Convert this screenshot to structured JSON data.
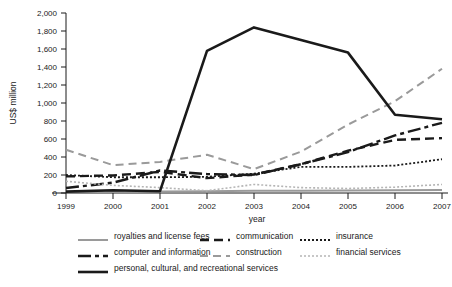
{
  "chart_data": {
    "type": "line",
    "title": "",
    "xlabel": "year",
    "ylabel": "US$ million",
    "x": [
      1999,
      2000,
      2001,
      2002,
      2003,
      2004,
      2005,
      2006,
      2007
    ],
    "xtick_labels": [
      "1999",
      "2000",
      "2001",
      "2002",
      "2003",
      "2004",
      "2005",
      "2006",
      "2007"
    ],
    "ytick_labels": [
      "0",
      "200",
      "400",
      "600",
      "800",
      "1,000",
      "1,200",
      "1,400",
      "1,600",
      "1,800",
      "2,000"
    ],
    "yticks": [
      0,
      200,
      400,
      600,
      800,
      1000,
      1200,
      1400,
      1600,
      1800,
      2000
    ],
    "ylim": [
      0,
      2000
    ],
    "grid": false,
    "legend_position": "below",
    "series": [
      {
        "name": "royalties and license fees",
        "style": "solid",
        "color": "#9a9a9a",
        "width": 2.0,
        "dash": "none",
        "values": [
          10,
          15,
          18,
          20,
          24,
          26,
          28,
          30,
          32
        ]
      },
      {
        "name": "communication",
        "style": "dashed",
        "color": "#1a1a1a",
        "width": 2.4,
        "dash": "9,5",
        "values": [
          185,
          195,
          235,
          165,
          205,
          320,
          470,
          590,
          610
        ]
      },
      {
        "name": "insurance",
        "style": "dotted",
        "color": "#1a1a1a",
        "width": 1.8,
        "dash": "2,2",
        "values": [
          200,
          175,
          175,
          180,
          215,
          290,
          290,
          305,
          375
        ]
      },
      {
        "name": "computer and information",
        "style": "dash-dot",
        "color": "#1a1a1a",
        "width": 2.4,
        "dash": "13,4,4,4",
        "values": [
          55,
          115,
          250,
          210,
          200,
          320,
          455,
          640,
          780
        ]
      },
      {
        "name": "construction",
        "style": "dashed",
        "color": "#9a9a9a",
        "width": 2.0,
        "dash": "8,5",
        "values": [
          480,
          310,
          345,
          425,
          265,
          460,
          760,
          1020,
          1380
        ]
      },
      {
        "name": "financial services",
        "style": "dotted",
        "color": "#b5b5b5",
        "width": 1.6,
        "dash": "2,2",
        "values": [
          130,
          85,
          60,
          25,
          95,
          60,
          50,
          65,
          95
        ]
      },
      {
        "name": "personal, cultural, and recreational services",
        "style": "solid",
        "color": "#1a1a1a",
        "width": 2.6,
        "dash": "none",
        "values": [
          15,
          30,
          20,
          1580,
          1840,
          1700,
          1560,
          870,
          820
        ]
      }
    ]
  },
  "legend": {
    "rows": [
      [
        {
          "key": "royalties-and-license-fees",
          "label": "royalties and license fees"
        },
        {
          "key": "communication",
          "label": "communication"
        },
        {
          "key": "insurance",
          "label": "insurance"
        }
      ],
      [
        {
          "key": "computer-and-information",
          "label": "computer and information"
        },
        {
          "key": "construction",
          "label": "construction"
        },
        {
          "key": "financial-services",
          "label": "financial services"
        }
      ],
      [
        {
          "key": "personal-cultural-and-recreational-services",
          "label": "personal, cultural, and recreational services"
        }
      ]
    ]
  }
}
